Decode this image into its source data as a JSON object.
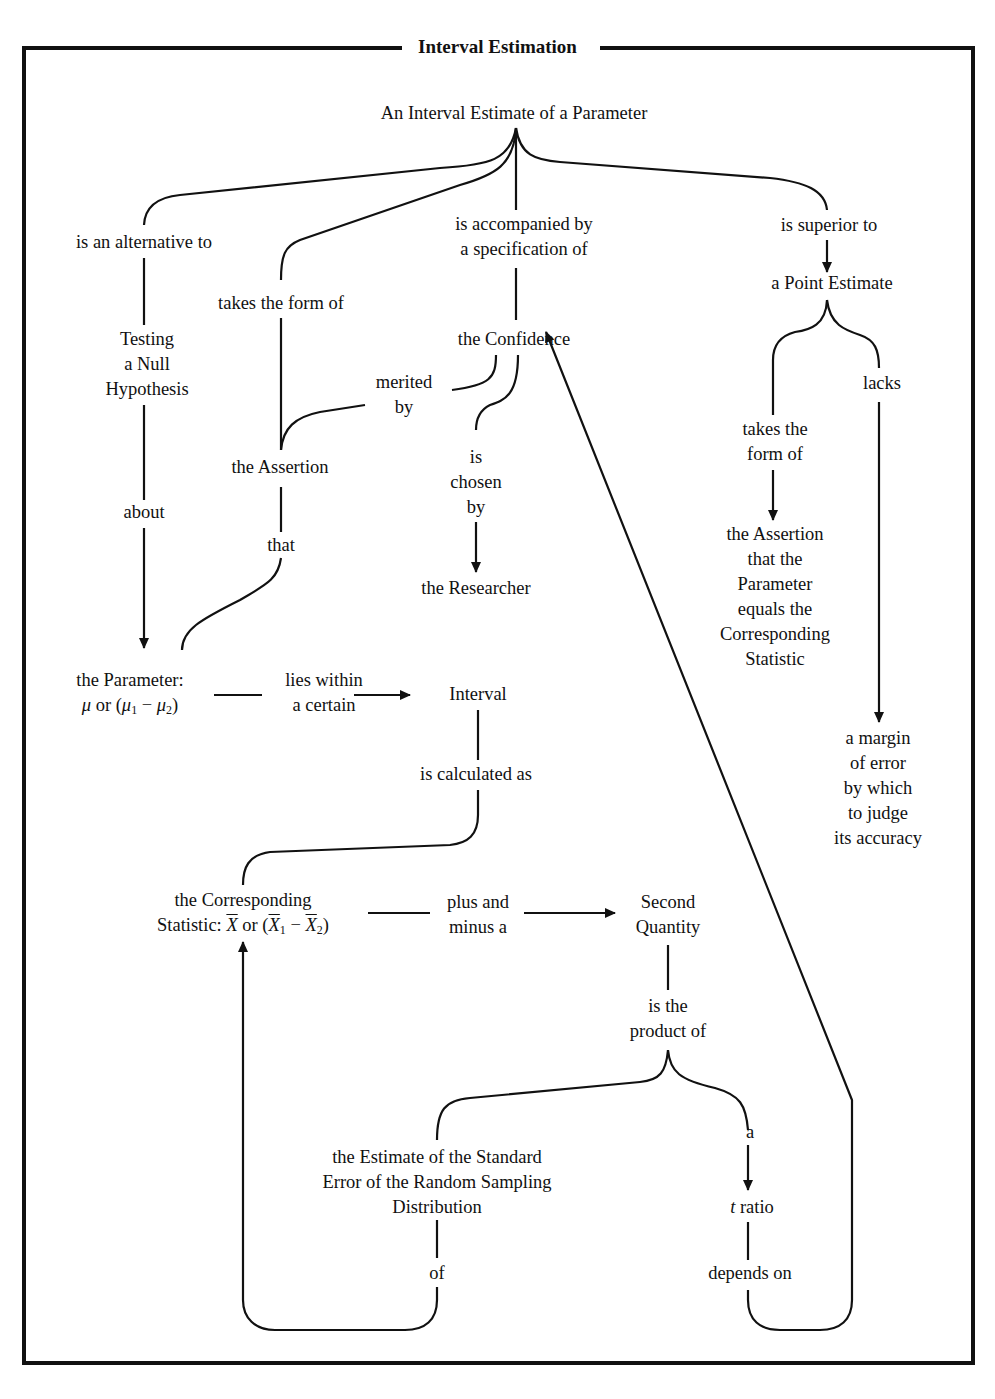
{
  "title": "Interval Estimation",
  "nodes": {
    "root": "An Interval Estimate of a Parameter",
    "testing": [
      "Testing",
      "a Null",
      "Hypothesis"
    ],
    "assertion": "the Assertion",
    "confidence": "the Confidence",
    "researcher": "the Researcher",
    "point_estimate": "a Point Estimate",
    "assertion_equals": [
      "the Assertion",
      "that the",
      "Parameter",
      "equals the",
      "Corresponding",
      "Statistic"
    ],
    "margin": [
      "a margin",
      "of error",
      "by which",
      "to judge",
      "its accuracy"
    ],
    "parameter_line1": "the Parameter:",
    "parameter_line2": {
      "mu": "μ",
      "or": "or (",
      "mu1": "μ",
      "sub1": "1",
      "minus": " − ",
      "mu2": "μ",
      "sub2": "2",
      "close": ")"
    },
    "interval": "Interval",
    "statistic_line1": "the Corresponding",
    "statistic_line2": {
      "prefix": "Statistic: ",
      "x": "X",
      "or": " or (",
      "x1": "X",
      "sub1": "1",
      "minus": " − ",
      "x2": "X",
      "sub2": "2",
      "close": ")"
    },
    "second_quantity": [
      "Second",
      "Quantity"
    ],
    "standard_error": [
      "the Estimate of the Standard",
      "Error of the Random Sampling",
      "Distribution"
    ],
    "t_ratio": {
      "t": "t",
      "rest": " ratio"
    }
  },
  "links": {
    "alternative": "is an alternative to",
    "takes_form": "takes the form of",
    "accompanied": [
      "is accompanied by",
      "a specification of"
    ],
    "superior": "is superior to",
    "merited": [
      "merited",
      "by"
    ],
    "chosen": [
      "is",
      "chosen",
      "by"
    ],
    "about": "about",
    "that": "that",
    "pe_takes_form": [
      "takes the",
      "form of"
    ],
    "lacks": "lacks",
    "lies_within": [
      "lies within",
      "a certain"
    ],
    "calculated": "is calculated as",
    "plus_minus": [
      "plus and",
      "minus a"
    ],
    "product": [
      "is the",
      "product of"
    ],
    "a": "a",
    "of": "of",
    "depends_on": "depends on"
  }
}
